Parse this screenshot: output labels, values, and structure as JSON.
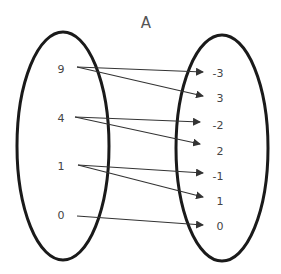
{
  "title": "A",
  "domain_set": [
    "9",
    "4",
    "1",
    "0"
  ],
  "range_set": [
    "-3",
    "3",
    "-2",
    "2",
    "-1",
    "1",
    "0"
  ],
  "mappings": [
    {
      "from": "9",
      "to": "-3"
    },
    {
      "from": "9",
      "to": "3"
    },
    {
      "from": "4",
      "to": "-2"
    },
    {
      "from": "4",
      "to": "2"
    },
    {
      "from": "1",
      "to": "-1"
    },
    {
      "from": "1",
      "to": "1"
    },
    {
      "from": "0",
      "to": "0"
    }
  ],
  "colors": {
    "outline": "#1a1a1a",
    "text": "#444444",
    "arrow": "#333333"
  }
}
